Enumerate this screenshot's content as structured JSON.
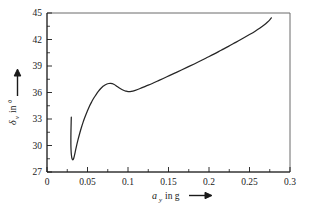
{
  "chart_data": {
    "type": "line",
    "title": "",
    "subtitle": "",
    "xlabel": "a_y in g",
    "xlabel_symbol": "a",
    "xlabel_subscript": "y",
    "xlabel_rest": "in g",
    "ylabel": "δ_v in °",
    "ylabel_symbol": "δ",
    "ylabel_subscript": "v",
    "ylabel_rest": "in °",
    "xlim": [
      0,
      0.3
    ],
    "ylim": [
      27,
      45
    ],
    "xticks": [
      0,
      0.05,
      0.1,
      0.15,
      0.2,
      0.25,
      0.3
    ],
    "xtick_labels": [
      "0",
      "0.05",
      "0.1",
      "0.15",
      "0.2",
      "0.25",
      "0.3"
    ],
    "xticks_minor": [
      0.025,
      0.075,
      0.125,
      0.175,
      0.225,
      0.275
    ],
    "yticks": [
      27,
      30,
      33,
      36,
      39,
      42,
      45
    ],
    "ytick_labels": [
      "27",
      "30",
      "33",
      "36",
      "39",
      "42",
      "45"
    ],
    "yticks_minor": [
      28.5,
      31.5,
      34.5,
      37.5,
      40.5,
      43.5
    ],
    "grid": false,
    "legend": null,
    "legend_position": "none",
    "series": [
      {
        "name": "steering angle vs lateral acceleration",
        "x": [
          0.03,
          0.0298,
          0.0296,
          0.0295,
          0.0295,
          0.0297,
          0.0301,
          0.0306,
          0.0312,
          0.0318,
          0.0324,
          0.033,
          0.0337,
          0.0348,
          0.0362,
          0.038,
          0.04,
          0.0422,
          0.0446,
          0.047,
          0.0496,
          0.0524,
          0.0552,
          0.058,
          0.0608,
          0.0636,
          0.0664,
          0.0692,
          0.0716,
          0.074,
          0.0762,
          0.0784,
          0.0806,
          0.083,
          0.0856,
          0.0884,
          0.0914,
          0.0944,
          0.0972,
          0.1,
          0.104,
          0.109,
          0.115,
          0.122,
          0.13,
          0.139,
          0.148,
          0.157,
          0.166,
          0.176,
          0.186,
          0.196,
          0.206,
          0.215,
          0.224,
          0.233,
          0.242,
          0.25,
          0.257,
          0.263,
          0.268,
          0.272,
          0.275,
          0.277
        ],
        "y": [
          33.2,
          32.5,
          31.7,
          30.9,
          30.1,
          29.45,
          28.95,
          28.62,
          28.44,
          28.38,
          28.42,
          28.56,
          28.8,
          29.25,
          29.85,
          30.55,
          31.25,
          31.95,
          32.65,
          33.25,
          33.85,
          34.45,
          34.95,
          35.4,
          35.8,
          36.15,
          36.45,
          36.7,
          36.85,
          36.96,
          37.02,
          37.04,
          37.0,
          36.9,
          36.74,
          36.56,
          36.4,
          36.26,
          36.16,
          36.1,
          36.12,
          36.25,
          36.45,
          36.72,
          37.02,
          37.4,
          37.78,
          38.16,
          38.55,
          38.98,
          39.42,
          39.88,
          40.34,
          40.78,
          41.22,
          41.68,
          42.14,
          42.56,
          42.94,
          43.3,
          43.64,
          43.95,
          44.22,
          44.45
        ]
      }
    ],
    "annotations": []
  },
  "axes": {
    "x_arrow": "arrow-right",
    "y_arrow": "arrow-up"
  }
}
